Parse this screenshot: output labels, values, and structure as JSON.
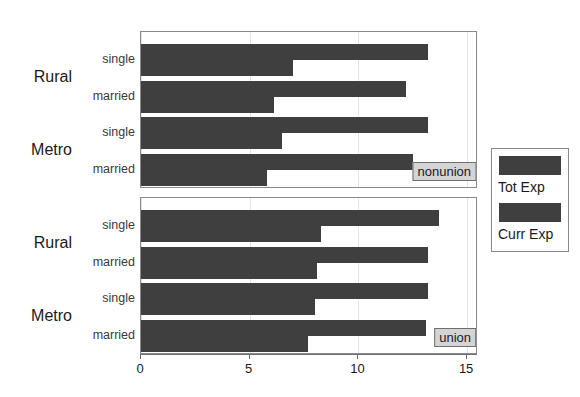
{
  "chart_data": {
    "type": "bar",
    "orientation": "horizontal",
    "title": "",
    "xlabel": "",
    "ylabel": "",
    "xlim": [
      0,
      15.5
    ],
    "xticks": [
      0,
      5,
      10,
      15
    ],
    "xticklabels": [
      "0",
      "5",
      "10",
      "15"
    ],
    "grid": "vertical",
    "legend": {
      "position": "right",
      "entries": [
        {
          "label": "Tot Exp",
          "color": "#3f3f3f"
        },
        {
          "label": "Curr Exp",
          "color": "#3f3f3f"
        }
      ]
    },
    "series": [
      {
        "name": "Tot Exp"
      },
      {
        "name": "Curr Exp"
      }
    ],
    "panels": [
      {
        "strip": "nonunion",
        "groups": [
          {
            "label": "Rural",
            "levels": [
              {
                "label": "single",
                "Tot Exp": 13.2,
                "Curr Exp": 7.0
              },
              {
                "label": "married",
                "Tot Exp": 12.2,
                "Curr Exp": 6.1
              }
            ]
          },
          {
            "label": "Metro",
            "levels": [
              {
                "label": "single",
                "Tot Exp": 13.2,
                "Curr Exp": 6.5
              },
              {
                "label": "married",
                "Tot Exp": 12.5,
                "Curr Exp": 5.8
              }
            ]
          }
        ]
      },
      {
        "strip": "union",
        "groups": [
          {
            "label": "Rural",
            "levels": [
              {
                "label": "single",
                "Tot Exp": 13.7,
                "Curr Exp": 8.3
              },
              {
                "label": "married",
                "Tot Exp": 13.2,
                "Curr Exp": 8.1
              }
            ]
          },
          {
            "label": "Metro",
            "levels": [
              {
                "label": "single",
                "Tot Exp": 13.2,
                "Curr Exp": 8.0
              },
              {
                "label": "married",
                "Tot Exp": 13.1,
                "Curr Exp": 7.7
              }
            ]
          }
        ]
      }
    ]
  }
}
